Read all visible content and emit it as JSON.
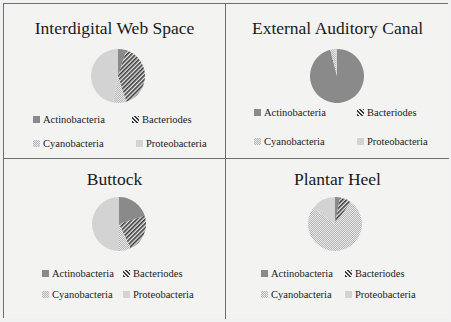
{
  "legend_labels": [
    "Actinobacteria",
    "Bacteriodes",
    "Cyanobacteria",
    "Proteobacteria"
  ],
  "colors": {
    "actinobacteria": "#8a8a8a",
    "bacteriodes_stripe_dark": "#3a3a3a",
    "bacteriodes_stripe_light": "#e8e8e8",
    "cyanobacteria_dot": "#b5b5b5",
    "cyanobacteria_bg": "#e9e9e9",
    "proteobacteria": "#d3d3d3",
    "border": "#6e6e6e",
    "background": "#f1f1f1"
  },
  "chart_data": [
    {
      "type": "pie",
      "title": "Interdigital Web Space",
      "categories": [
        "Actinobacteria",
        "Bacteriodes",
        "Cyanobacteria",
        "Proteobacteria"
      ],
      "values": [
        5,
        40,
        8,
        47
      ],
      "legend_position": "bottom"
    },
    {
      "type": "pie",
      "title": "External Auditory Canal",
      "categories": [
        "Actinobacteria",
        "Bacteriodes",
        "Cyanobacteria",
        "Proteobacteria"
      ],
      "values": [
        96,
        0,
        3,
        1
      ],
      "legend_position": "bottom"
    },
    {
      "type": "pie",
      "title": "Buttock",
      "categories": [
        "Actinobacteria",
        "Bacteriodes",
        "Cyanobacteria",
        "Proteobacteria"
      ],
      "values": [
        20,
        23,
        7,
        50
      ],
      "legend_position": "bottom"
    },
    {
      "type": "pie",
      "title": "Plantar Heel",
      "categories": [
        "Actinobacteria",
        "Bacteriodes",
        "Cyanobacteria",
        "Proteobacteria"
      ],
      "values": [
        3,
        7,
        75,
        15
      ],
      "legend_position": "bottom"
    }
  ]
}
